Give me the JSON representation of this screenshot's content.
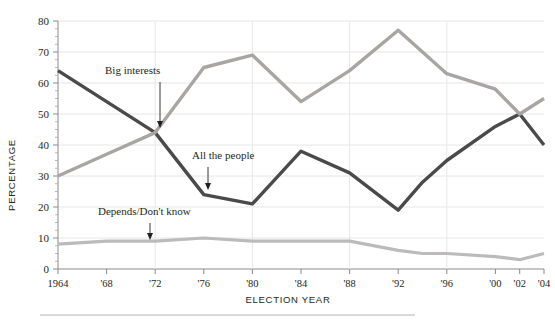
{
  "topnote": {
    "left": "",
    "right": ""
  },
  "chart_data": {
    "type": "line",
    "title": "",
    "xlabel": "ELECTION YEAR",
    "ylabel": "PERCENTAGE",
    "x": [
      1964,
      1968,
      1972,
      1976,
      1980,
      1984,
      1988,
      1992,
      1994,
      1996,
      2000,
      2002,
      2004
    ],
    "xtick_labels": [
      "1964",
      "'68",
      "'72",
      "'76",
      "'80",
      "'84",
      "'88",
      "'92",
      "'96",
      "'00",
      "'02",
      "'04"
    ],
    "xtick_values": [
      1964,
      1968,
      1972,
      1976,
      1980,
      1984,
      1988,
      1992,
      1996,
      2000,
      2002,
      2004
    ],
    "xlim": [
      1964,
      2004
    ],
    "ylim": [
      0,
      80
    ],
    "ytick_labels": [
      "0",
      "10",
      "20",
      "30",
      "40",
      "50",
      "60",
      "70",
      "80"
    ],
    "ytick_values": [
      0,
      10,
      20,
      30,
      40,
      50,
      60,
      70,
      80
    ],
    "grid": true,
    "legend": "annotations",
    "series": [
      {
        "name": "All the people",
        "color": "#4a4a4a",
        "values": [
          64,
          54,
          44,
          24,
          21,
          38,
          31,
          19,
          28,
          35,
          46,
          50,
          40
        ]
      },
      {
        "name": "Big interests",
        "color": "#a8a5a3",
        "values": [
          30,
          37,
          44,
          65,
          69,
          54,
          64,
          77,
          70,
          63,
          58,
          50,
          55
        ]
      },
      {
        "name": "Depends/Don't know",
        "color": "#bcbabb",
        "values": [
          8,
          9,
          9,
          10,
          9,
          9,
          9,
          6,
          5,
          5,
          4,
          3,
          5
        ]
      }
    ],
    "annotations": [
      {
        "label": "Big interests",
        "target_series": "Big interests",
        "target_x": 1972,
        "target_y": 44
      },
      {
        "label": "All the people",
        "target_series": "All the people",
        "target_x": 1977,
        "target_y": 23
      },
      {
        "label": "Depends/Don't know",
        "target_series": "Depends/Don't know",
        "target_x": 1972,
        "target_y": 9
      }
    ]
  }
}
